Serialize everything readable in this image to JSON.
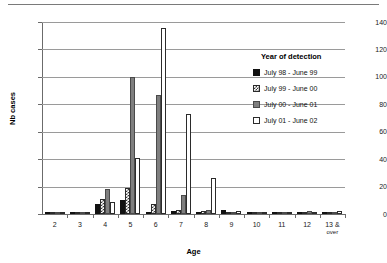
{
  "chart_data": {
    "type": "bar",
    "title": "",
    "xlabel": "Age",
    "ylabel": "Nb cases",
    "ylim": [
      0,
      140
    ],
    "ytick_step": 20,
    "yticks": [
      "0",
      "20",
      "40",
      "60",
      "80",
      "100",
      "120",
      "140"
    ],
    "grid": true,
    "legend_position": "right",
    "legend_title": "Year of detection",
    "categories": [
      "2",
      "3",
      "4",
      "5",
      "6",
      "7",
      "8",
      "9",
      "10",
      "11",
      "12",
      "13 & over"
    ],
    "categories_display": [
      {
        "main": "2",
        "sub": ""
      },
      {
        "main": "3",
        "sub": ""
      },
      {
        "main": "4",
        "sub": ""
      },
      {
        "main": "5",
        "sub": ""
      },
      {
        "main": "6",
        "sub": ""
      },
      {
        "main": "7",
        "sub": ""
      },
      {
        "main": "8",
        "sub": ""
      },
      {
        "main": "9",
        "sub": ""
      },
      {
        "main": "10",
        "sub": ""
      },
      {
        "main": "11",
        "sub": ""
      },
      {
        "main": "12",
        "sub": ""
      },
      {
        "main": "13 &",
        "sub": "over"
      }
    ],
    "series": [
      {
        "name": "July 98 - June 99",
        "fill": "solid-black",
        "color": "#111111",
        "values": [
          0,
          1,
          7,
          10,
          1,
          2,
          1,
          3,
          0,
          0,
          0,
          0
        ]
      },
      {
        "name": "July 99 - June 00",
        "fill": "checkered",
        "color": "#3a3a3a",
        "values": [
          1,
          1,
          11,
          19,
          7,
          3,
          2,
          1,
          1,
          0,
          0,
          0
        ]
      },
      {
        "name": "July 00 - June 01",
        "fill": "gray",
        "color": "#7f7f7f",
        "values": [
          0,
          0,
          18,
          100,
          87,
          14,
          3,
          0,
          1,
          0,
          2,
          0
        ]
      },
      {
        "name": "July 01 - June 02",
        "fill": "white",
        "color": "#ffffff",
        "values": [
          0,
          1,
          9,
          41,
          136,
          73,
          26,
          2,
          0,
          1,
          0,
          2
        ]
      }
    ]
  },
  "legend": {
    "title": "Year of detection",
    "items": [
      {
        "label": "July 98 - June 99"
      },
      {
        "label": "July 99 - June 00"
      },
      {
        "label": "July 00 - June 01"
      },
      {
        "label": "July 01 - June 02"
      }
    ]
  },
  "axes": {
    "x_title": "Age",
    "y_title": "Nb cases"
  }
}
